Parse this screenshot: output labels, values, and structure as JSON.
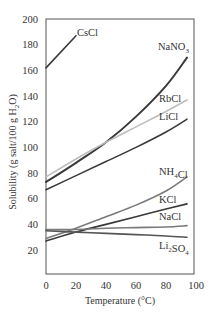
{
  "chart_data": {
    "type": "line",
    "title": "",
    "xlabel": "Temperature (°C)",
    "ylabel": "Solubility (g salt/100 g H2O)",
    "xlim": [
      0,
      100
    ],
    "ylim": [
      0,
      200
    ],
    "xticks": [
      0,
      20,
      40,
      60,
      80,
      100
    ],
    "yticks": [
      20,
      40,
      60,
      80,
      100,
      120,
      140,
      160,
      180,
      200
    ],
    "grid": false,
    "legend": "inline labels",
    "series": [
      {
        "name": "CsCl",
        "color": "#3a3a3a",
        "x": [
          0,
          20
        ],
        "values": [
          162,
          187
        ]
      },
      {
        "name": "NaNO3",
        "color": "#3a3a3a",
        "x": [
          0,
          20,
          40,
          60,
          80,
          94
        ],
        "values": [
          73,
          88,
          104,
          124,
          148,
          170
        ]
      },
      {
        "name": "RbCl",
        "color": "#bdbdbd",
        "x": [
          0,
          20,
          40,
          60,
          80,
          94
        ],
        "values": [
          77,
          91,
          104,
          116,
          128,
          137
        ]
      },
      {
        "name": "LiCl",
        "color": "#3a3a3a",
        "x": [
          0,
          20,
          40,
          60,
          80,
          94
        ],
        "values": [
          67,
          78,
          89,
          100,
          112,
          122
        ]
      },
      {
        "name": "NH4Cl",
        "color": "#7a7a7a",
        "x": [
          0,
          20,
          40,
          60,
          80,
          94
        ],
        "values": [
          29,
          37,
          46,
          55,
          66,
          77
        ]
      },
      {
        "name": "KCl",
        "color": "#3a3a3a",
        "x": [
          0,
          20,
          40,
          60,
          80,
          94
        ],
        "values": [
          27,
          34,
          40,
          46,
          52,
          56
        ]
      },
      {
        "name": "NaCl",
        "color": "#7a7a7a",
        "x": [
          0,
          20,
          40,
          60,
          80,
          94
        ],
        "values": [
          36,
          36,
          37,
          37.5,
          38,
          39
        ]
      },
      {
        "name": "Li2SO4",
        "color": "#555555",
        "x": [
          0,
          20,
          40,
          60,
          80,
          94
        ],
        "values": [
          35,
          34,
          33,
          32,
          31,
          30
        ]
      }
    ],
    "labels": [
      {
        "text": "CsCl",
        "series": "CsCl"
      },
      {
        "text": "NaNO3",
        "series": "NaNO3"
      },
      {
        "text": "RbCl",
        "series": "RbCl"
      },
      {
        "text": "LiCl",
        "series": "LiCl"
      },
      {
        "text": "NH4Cl",
        "series": "NH4Cl"
      },
      {
        "text": "KCl",
        "series": "KCl"
      },
      {
        "text": "NaCl",
        "series": "NaCl"
      },
      {
        "text": "Li2SO4",
        "series": "Li2SO4"
      }
    ]
  }
}
